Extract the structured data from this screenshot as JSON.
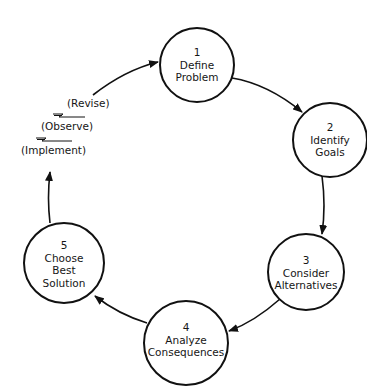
{
  "diagram": {
    "type": "cycle",
    "colors": {
      "stroke": "#111111",
      "fill": "#ffffff",
      "text": "#161616"
    },
    "nodes": [
      {
        "id": 1,
        "number": "1",
        "line1": "Define",
        "line2": "Problem",
        "line3": ""
      },
      {
        "id": 2,
        "number": "2",
        "line1": "Identify",
        "line2": "Goals",
        "line3": ""
      },
      {
        "id": 3,
        "number": "3",
        "line1": "Consider",
        "line2": "Alternatives",
        "line3": ""
      },
      {
        "id": 4,
        "number": "4",
        "line1": "Analyze",
        "line2": "Consequences",
        "line3": ""
      },
      {
        "id": 5,
        "number": "5",
        "line1": "Choose",
        "line2": "Best",
        "line3": "Solution"
      }
    ],
    "edges": [
      {
        "from": 1,
        "to": 2
      },
      {
        "from": 2,
        "to": 3
      },
      {
        "from": 3,
        "to": 4
      },
      {
        "from": 4,
        "to": 5
      },
      {
        "from": 5,
        "to": 1,
        "via": [
          "Implement",
          "Observe",
          "Revise"
        ]
      }
    ],
    "side_steps": {
      "revise": "(Revise)",
      "observe": "(Observe)",
      "implement": "(Implement)"
    }
  }
}
